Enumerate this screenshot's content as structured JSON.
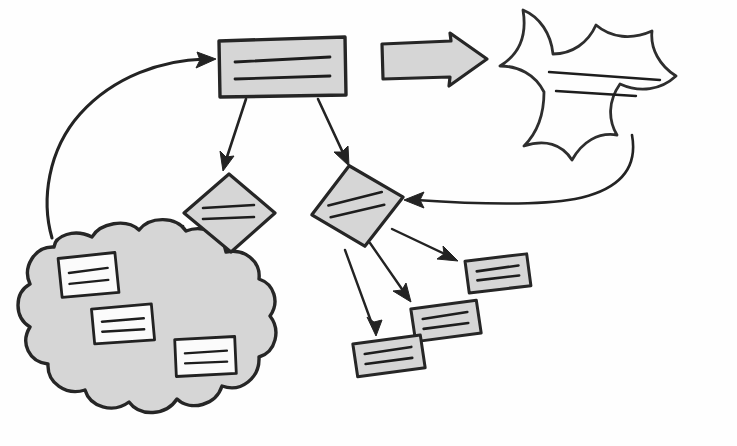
{
  "diagram": {
    "background_color": "#fefefe",
    "canvas": {
      "width": 737,
      "height": 446
    },
    "palette": {
      "shape_fill_gray": "#d6d6d6",
      "note_fill_white": "#fbfbfb",
      "stroke_dark": "#232323",
      "ink": "#1d1d1d"
    },
    "style": "hand-drawn marker sketch, no text labels, lines stand in for text"
  },
  "nodes": {
    "process_box": {
      "name": "process-rectangle",
      "shape": "rectangle",
      "fill": "#d6d6d6",
      "text_lines": 2,
      "position": {
        "x": 218,
        "y": 36,
        "width": 128,
        "height": 62
      }
    },
    "block_arrow": {
      "name": "block-arrow-right",
      "shape": "block-arrow",
      "direction": "right",
      "fill": "#d6d6d6",
      "position": {
        "x": 381,
        "y": 34,
        "width": 105,
        "height": 52
      }
    },
    "starburst": {
      "name": "starburst-callout",
      "shape": "explosion-burst",
      "fill": "#ffffff",
      "text_lines": 2,
      "points": 7,
      "position": {
        "x": 498,
        "y": 8,
        "width": 222,
        "height": 160
      }
    },
    "decision_left": {
      "name": "decision-diamond-left",
      "shape": "diamond",
      "fill": "#d6d6d6",
      "text_lines": 2,
      "position": {
        "x": 183,
        "y": 174,
        "width": 92,
        "height": 78
      }
    },
    "decision_right": {
      "name": "decision-diamond-right",
      "shape": "diamond",
      "fill": "#d6d6d6",
      "text_lines": 2,
      "rotation_deg": -12,
      "position": {
        "x": 310,
        "y": 165,
        "width": 94,
        "height": 82
      }
    },
    "cloud": {
      "name": "cloud-grouping",
      "shape": "cloud",
      "fill": "#d6d6d6",
      "position": {
        "x": 10,
        "y": 222,
        "width": 258,
        "height": 206
      },
      "contains": 3
    }
  },
  "notes": {
    "cloud_notes": [
      {
        "name": "cloud-note-1",
        "fill": "#fbfbfb",
        "text_lines": 2,
        "x": 59,
        "y": 256,
        "width": 56,
        "height": 38,
        "rotation_deg": -3
      },
      {
        "name": "cloud-note-2",
        "fill": "#fbfbfb",
        "text_lines": 2,
        "x": 92,
        "y": 307,
        "width": 60,
        "height": 34,
        "rotation_deg": -2
      },
      {
        "name": "cloud-note-3",
        "fill": "#fbfbfb",
        "text_lines": 2,
        "x": 175,
        "y": 338,
        "width": 60,
        "height": 36,
        "rotation_deg": -1
      }
    ],
    "loose_notes": [
      {
        "name": "loose-note-top",
        "fill": "#d6d6d6",
        "text_lines": 2,
        "x": 466,
        "y": 258,
        "width": 62,
        "height": 32,
        "rotation_deg": -4
      },
      {
        "name": "loose-note-middle",
        "fill": "#d6d6d6",
        "text_lines": 2,
        "x": 412,
        "y": 305,
        "width": 66,
        "height": 32,
        "rotation_deg": -5
      },
      {
        "name": "loose-note-bottom",
        "fill": "#d6d6d6",
        "text_lines": 2,
        "x": 354,
        "y": 340,
        "width": 68,
        "height": 32,
        "rotation_deg": -5
      }
    ]
  },
  "connectors": [
    {
      "name": "connector-cloud-to-box",
      "from": "cloud",
      "to": "process_box",
      "style": "long-curve",
      "arrow_at": "to"
    },
    {
      "name": "connector-box-to-diamond-left",
      "from": "process_box",
      "to": "decision_left",
      "style": "straight",
      "arrow_at": "to"
    },
    {
      "name": "connector-box-to-diamond-right",
      "from": "process_box",
      "to": "decision_right",
      "style": "straight",
      "arrow_at": "to"
    },
    {
      "name": "connector-starburst-to-diamond-right",
      "from": "starburst",
      "to": "decision_right",
      "style": "long-curve",
      "arrow_at": "to"
    },
    {
      "name": "connector-diamond-left-to-note-1",
      "from": "decision_left",
      "to": "cloud_note_1",
      "style": "straight",
      "arrow_at": "to"
    },
    {
      "name": "connector-diamond-left-to-note-2",
      "from": "decision_left",
      "to": "cloud_note_2",
      "style": "straight",
      "arrow_at": "to"
    },
    {
      "name": "connector-diamond-left-to-note-3",
      "from": "decision_left",
      "to": "cloud_note_3",
      "style": "straight",
      "arrow_at": "to"
    },
    {
      "name": "connector-diamond-right-to-loose-note-top",
      "from": "decision_right",
      "to": "loose_note_top",
      "style": "straight",
      "arrow_at": "to"
    },
    {
      "name": "connector-diamond-right-to-loose-note-middle",
      "from": "decision_right",
      "to": "loose_note_middle",
      "style": "straight",
      "arrow_at": "to"
    },
    {
      "name": "connector-diamond-right-to-loose-note-bottom",
      "from": "decision_right",
      "to": "loose_note_bottom",
      "style": "straight",
      "arrow_at": "to"
    }
  ]
}
